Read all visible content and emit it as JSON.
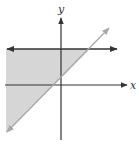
{
  "diagram": {
    "type": "graph-of-linear-inequalities",
    "axes": {
      "x_label": "x",
      "y_label": "y",
      "color": "#333333"
    },
    "lines": [
      {
        "name": "horizontal-boundary",
        "kind": "horizontal",
        "color": "#333333",
        "arrows": "both"
      },
      {
        "name": "diagonal-boundary",
        "kind": "slope-positive",
        "color": "#a8a8a8",
        "arrows": "both"
      }
    ],
    "shaded_region": {
      "description": "below horizontal line and above/left of diagonal line",
      "fill": "#d6d6d6"
    }
  }
}
